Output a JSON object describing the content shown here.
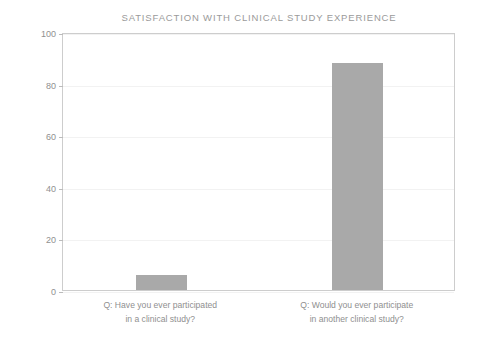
{
  "chart_data": {
    "type": "bar",
    "title": "SATISFACTION WITH CLINICAL STUDY EXPERIENCE",
    "xlabel": "",
    "ylabel": "Percent Responding \"Yes\"",
    "ylim": [
      0,
      100
    ],
    "yticks": [
      0,
      20,
      40,
      60,
      80,
      100
    ],
    "ytick_labels": [
      "0",
      "20",
      "40",
      "60",
      "80",
      "100"
    ],
    "grid": true,
    "legend": "none",
    "bar_color": "#a9a9a9",
    "categories": [
      "Q:  Have you ever participated in a clinical study?",
      "Q:  Would you ever participate in another clinical study?"
    ],
    "category_lines": [
      [
        "Q:  Have you ever participated",
        "in a clinical study?"
      ],
      [
        "Q:  Would you ever participate",
        "in another clinical study?"
      ]
    ],
    "values": [
      6,
      88
    ]
  },
  "style": {
    "background": "#ffffff",
    "text_color": "#8f8f8f",
    "title_color": "#9a9a9a",
    "frame_color": "#cdcdcd",
    "gridline_color": "#f2f2f2",
    "tick_color": "#bbbbbb"
  }
}
